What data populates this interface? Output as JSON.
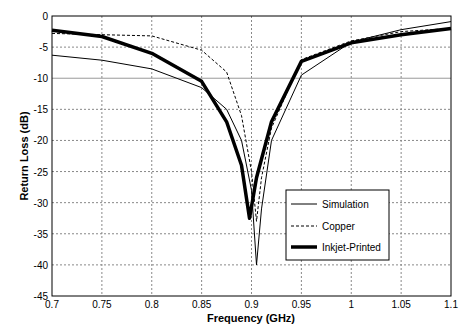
{
  "chart_data": {
    "type": "line",
    "title": "",
    "xlabel": "Frequency (GHz)",
    "ylabel": "Return Loss (dB)",
    "xlim": [
      0.7,
      1.1
    ],
    "ylim": [
      -45,
      0
    ],
    "xticks": [
      "0.7",
      "0.75",
      "0.8",
      "0.85",
      "0.9",
      "0.95",
      "1",
      "1.05",
      "1.1"
    ],
    "yticks": [
      "0",
      "-5",
      "-10",
      "-15",
      "-20",
      "-25",
      "-30",
      "-35",
      "-40",
      "-45"
    ],
    "grid": true,
    "legend_position": "lower right",
    "series": [
      {
        "name": "Simulation",
        "style": "thin-solid",
        "x": [
          0.7,
          0.75,
          0.8,
          0.85,
          0.875,
          0.89,
          0.9,
          0.905,
          0.91,
          0.92,
          0.95,
          1.0,
          1.05,
          1.1
        ],
        "y": [
          -6.3,
          -7.1,
          -8.5,
          -11.5,
          -15,
          -20,
          -28,
          -40,
          -31,
          -20,
          -9.5,
          -4.2,
          -2.2,
          -0.9
        ]
      },
      {
        "name": "Copper",
        "style": "dashed",
        "x": [
          0.7,
          0.75,
          0.8,
          0.85,
          0.875,
          0.89,
          0.9,
          0.905,
          0.91,
          0.92,
          0.95,
          1.0,
          1.05,
          1.1
        ],
        "y": [
          -2.8,
          -3.0,
          -3.2,
          -5.5,
          -9,
          -16,
          -25,
          -33,
          -26,
          -18,
          -7,
          -4,
          -2.5,
          -2
        ]
      },
      {
        "name": "Inkjet-Printed",
        "style": "thick-solid",
        "x": [
          0.7,
          0.75,
          0.8,
          0.85,
          0.875,
          0.89,
          0.898,
          0.905,
          0.92,
          0.95,
          1.0,
          1.05,
          1.1
        ],
        "y": [
          -2.3,
          -3.3,
          -6,
          -10.5,
          -17,
          -24,
          -32.5,
          -26,
          -17,
          -7.3,
          -4.3,
          -3,
          -2
        ]
      }
    ]
  }
}
